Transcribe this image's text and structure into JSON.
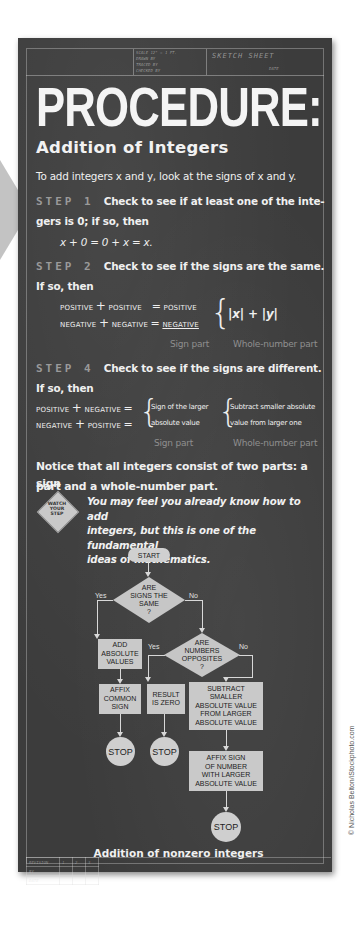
{
  "title_block": {
    "scale": "SCALE  12\" = 1 FT.",
    "drawn_by": "DRAWN BY",
    "traced_by": "TRACED BY",
    "checked_by": "CHECKED BY",
    "sheet_label": "SKETCH SHEET",
    "date": "DATE"
  },
  "heading": "PROCEDURE:",
  "subheading": "Addition of Integers",
  "intro": "To add integers x and y, look at the signs of x and y.",
  "steps": [
    {
      "label": "STEP 1",
      "text_line1": "Check to see if at least one of the inte-",
      "text_line2": "gers is 0; if so, then",
      "formula": "x + 0 = 0 + x = x."
    },
    {
      "label": "STEP 2",
      "text_line1": "Check to see if the signs are the same.",
      "text_line2": "If so, then",
      "rows": [
        {
          "left": "POSITIVE",
          "op": "+",
          "right": "POSITIVE",
          "eq": "=",
          "result": "POSITIVE"
        },
        {
          "left": "NEGATIVE",
          "op": "+",
          "right": "NEGATIVE",
          "eq": "=",
          "result": "NEGATIVE"
        }
      ],
      "whole_number_expr": "|x| + |y|",
      "sign_part_label": "Sign part",
      "whole_part_label": "Whole-number part"
    },
    {
      "label": "STEP 4",
      "text_line1": "Check to see if the signs are different.",
      "text_line2": "If so, then",
      "rows": [
        {
          "left": "POSITIVE",
          "op": "+",
          "right": "NEGATIVE",
          "eq": "="
        },
        {
          "left": "NEGATIVE",
          "op": "+",
          "right": "POSITIVE",
          "eq": "="
        }
      ],
      "sign_rule_line1": "Sign of the larger",
      "sign_rule_line2": "absolute value",
      "whole_rule_line1": "Subtract smaller absolute",
      "whole_rule_line2": "value from larger one",
      "sign_part_label": "Sign part",
      "whole_part_label": "Whole-number part"
    }
  ],
  "notice_line1": "Notice that all integers consist of two parts: a sign",
  "notice_line2": "part and a whole-number part.",
  "warning_sign": {
    "line1": "WATCH",
    "line2": "YOUR",
    "line3": "STEP"
  },
  "note_line1": "You may feel you already know how to add",
  "note_line2": "integers, but this is one of the fundamental",
  "note_line3": "ideas of mathematics.",
  "flowchart": {
    "start": "START",
    "decision1": {
      "l1": "ARE",
      "l2": "SIGNS THE",
      "l3": "SAME",
      "l4": "?"
    },
    "decision1_yes": "Yes",
    "decision1_no": "No",
    "add_abs": {
      "l1": "ADD",
      "l2": "ABSOLUTE",
      "l3": "VALUES"
    },
    "decision2": {
      "l1": "ARE",
      "l2": "NUMBERS",
      "l3": "OPPOSITES",
      "l4": "?"
    },
    "decision2_yes": "Yes",
    "decision2_no": "No",
    "affix_common": {
      "l1": "AFFIX",
      "l2": "COMMON",
      "l3": "SIGN"
    },
    "result_zero": {
      "l1": "RESULT",
      "l2": "IS ZERO"
    },
    "subtract": {
      "l1": "SUBTRACT",
      "l2": "SMALLER",
      "l3": "ABSOLUTE VALUE",
      "l4": "FROM LARGER",
      "l5": "ABSOLUTE VALUE"
    },
    "affix_sign": {
      "l1": "AFFIX SIGN",
      "l2": "OF NUMBER",
      "l3": "WITH LARGER",
      "l4": "ABSOLUTE VALUE"
    },
    "stop": "STOP",
    "caption": "Addition of nonzero integers"
  },
  "revision_table": {
    "revision": "REVISION",
    "cols": [
      "1",
      "2",
      "3"
    ],
    "by": "BY",
    "date": "DATE"
  },
  "credit": "© Nicholas Belton/iStockphoto.com"
}
